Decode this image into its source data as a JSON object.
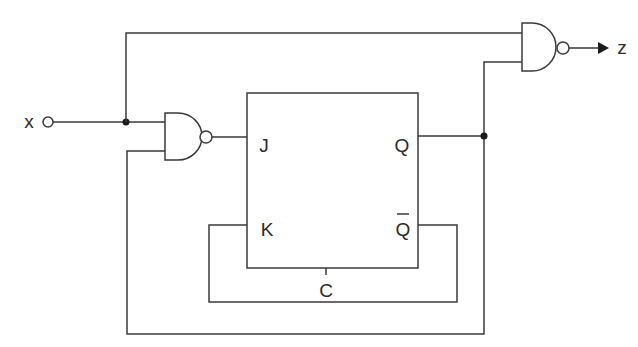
{
  "diagram": {
    "type": "sequential-logic-circuit",
    "input": {
      "label": "x"
    },
    "output": {
      "label": "z"
    },
    "flip_flop": {
      "type": "JK",
      "pins": {
        "j": "J",
        "k": "K",
        "q": "Q",
        "q_bar": "Q",
        "clock": "C"
      }
    },
    "gates": [
      {
        "id": "nand1",
        "type": "NAND",
        "inputs": [
          "x",
          "Q"
        ],
        "output": "J"
      },
      {
        "id": "nand2",
        "type": "NAND",
        "inputs": [
          "x",
          "Q"
        ],
        "output": "z"
      }
    ],
    "connections": [
      "x -> nand1.in1",
      "x -> nand2.in1",
      "nand1.out -> J",
      "Q -> nand2.in2",
      "Q -> nand1.in2",
      "Q_bar -> K",
      "Q_bar -> C"
    ],
    "colors": {
      "line": "#3a3a3a",
      "background": "#ffffff"
    }
  }
}
